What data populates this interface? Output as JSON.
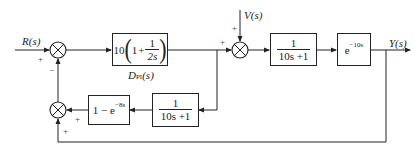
{
  "diagram": {
    "type": "control-system-block-diagram",
    "inputs": {
      "reference": "R(s)",
      "disturbance": "V(s)"
    },
    "output": "Y(s)",
    "blocks": {
      "controller": {
        "gain": "10",
        "one": "1",
        "plus": "+",
        "num": "1",
        "den": "2s",
        "label": "D",
        "label_sub": "PI",
        "label_arg": "(s)"
      },
      "plant": {
        "num": "1",
        "den": "10s +1"
      },
      "delay": {
        "base": "e",
        "exp": "−10s"
      },
      "model": {
        "num": "1",
        "den": "10s +1"
      },
      "smith": {
        "text": "1 − e",
        "exp": "−8s"
      }
    },
    "summing_junctions": {
      "sum1": {
        "signs": [
          "+",
          "−"
        ]
      },
      "sum2": {
        "signs": [
          "+",
          "+"
        ]
      },
      "sum3": {
        "signs": [
          "+",
          "+"
        ]
      }
    },
    "colors": {
      "line": "#222222",
      "background": "#ffffff"
    }
  }
}
